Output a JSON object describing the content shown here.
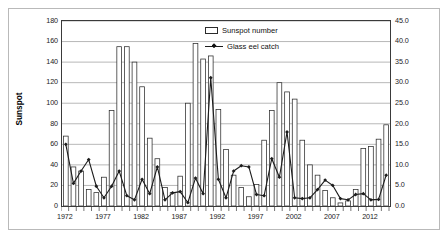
{
  "chart_data": {
    "type": "bar",
    "title": "",
    "subtitle": "",
    "xlabel": "",
    "ylabel": "Sunspot",
    "y2label": "Glass eel catch (tonnes)",
    "ylim": [
      0,
      180
    ],
    "y2lim": [
      0.0,
      45.0
    ],
    "grid": true,
    "legend_position": "top-center",
    "x": [
      1972,
      1973,
      1974,
      1975,
      1976,
      1977,
      1978,
      1979,
      1980,
      1981,
      1982,
      1983,
      1984,
      1985,
      1986,
      1987,
      1988,
      1989,
      1990,
      1991,
      1992,
      1993,
      1994,
      1995,
      1996,
      1997,
      1998,
      1999,
      2000,
      2001,
      2002,
      2003,
      2004,
      2005,
      2006,
      2007,
      2008,
      2009,
      2010,
      2011,
      2012,
      2013,
      2014
    ],
    "categories": [
      "1972",
      "1973",
      "1974",
      "1975",
      "1976",
      "1977",
      "1978",
      "1979",
      "1980",
      "1981",
      "1982",
      "1983",
      "1984",
      "1985",
      "1986",
      "1987",
      "1988",
      "1989",
      "1990",
      "1991",
      "1992",
      "1993",
      "1994",
      "1995",
      "1996",
      "1997",
      "1998",
      "1999",
      "2000",
      "2001",
      "2002",
      "2003",
      "2004",
      "2005",
      "2006",
      "2007",
      "2008",
      "2009",
      "2010",
      "2011",
      "2012",
      "2013",
      "2014"
    ],
    "xtick_labels": [
      "1972",
      "1977",
      "1982",
      "1987",
      "1992",
      "1997",
      "2002",
      "2007",
      "2012"
    ],
    "xtick_values": [
      1972,
      1977,
      1982,
      1987,
      1992,
      1997,
      2002,
      2007,
      2012
    ],
    "ytick_labels": [
      "0",
      "20",
      "40",
      "60",
      "80",
      "100",
      "120",
      "140",
      "160",
      "180"
    ],
    "ytick_values": [
      0,
      20,
      40,
      60,
      80,
      100,
      120,
      140,
      160,
      180
    ],
    "y2tick_labels": [
      "0.0",
      "5.0",
      "10.0",
      "15.0",
      "20.0",
      "25.0",
      "30.0",
      "35.0",
      "40.0",
      "45.0"
    ],
    "y2tick_values": [
      0,
      5,
      10,
      15,
      20,
      25,
      30,
      35,
      40,
      45
    ],
    "series": [
      {
        "name": "Sunspot number",
        "type": "bar",
        "axis": "left",
        "color": "#ffffff",
        "edge_color": "#2b2b2b",
        "values": [
          68,
          38,
          34,
          16,
          13,
          28,
          93,
          155,
          155,
          140,
          116,
          66,
          46,
          18,
          13,
          29,
          100,
          158,
          143,
          146,
          94,
          55,
          30,
          18,
          9,
          21,
          64,
          93,
          120,
          111,
          104,
          64,
          40,
          30,
          15,
          8,
          3,
          5,
          16,
          56,
          58,
          65,
          79
        ]
      },
      {
        "name": "Glass eel catch",
        "type": "line",
        "axis": "right",
        "color": "#1c1c1c",
        "marker": "diamond",
        "values": [
          15.0,
          5.5,
          8.5,
          11.3,
          4.8,
          2.0,
          4.8,
          8.5,
          2.5,
          1.5,
          6.5,
          3.0,
          9.5,
          1.5,
          3.2,
          3.5,
          0.8,
          6.8,
          3.0,
          31.2,
          6.5,
          2.0,
          8.5,
          9.8,
          9.5,
          2.8,
          2.5,
          11.5,
          7.0,
          18.0,
          2.0,
          1.8,
          2.0,
          4.0,
          6.3,
          5.0,
          1.8,
          1.5,
          2.8,
          3.0,
          1.5,
          1.6,
          7.5
        ]
      }
    ]
  },
  "legend": {
    "items": [
      {
        "label": "Sunspot number",
        "marker": "bar-swatch"
      },
      {
        "label": "Glass eel catch",
        "marker": "line-diamond"
      }
    ]
  },
  "axes": {
    "left_title": "Sunspot",
    "right_title": "Glass eel catch (tonnes)"
  },
  "colors": {
    "bar_fill": "#ffffff",
    "bar_edge": "#2b2b2b",
    "line": "#1c1c1c",
    "grid": "#9a9a9a",
    "axis": "#3a3a3a",
    "frame": "#b9b9b9",
    "text": "#111111"
  }
}
